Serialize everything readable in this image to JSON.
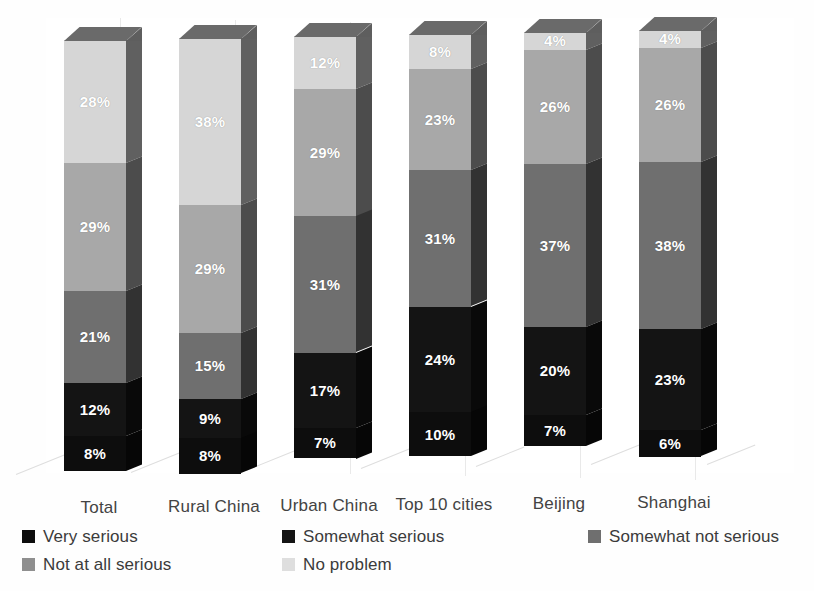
{
  "chart_data": {
    "type": "bar",
    "subtype": "stacked-column-100-3d",
    "title": "",
    "subtitle": "",
    "xlabel": "",
    "ylabel": "",
    "ylim": [
      0,
      100
    ],
    "grid": true,
    "legend_position": "bottom",
    "categories": [
      "Total",
      "Rural China",
      "Urban China",
      "Top 10 cities",
      "Beijing",
      "Shanghai"
    ],
    "series": [
      {
        "name": "Very serious",
        "color": "#0d0d0d",
        "values": [
          8,
          8,
          7,
          10,
          7,
          6
        ],
        "labels": [
          "8%",
          "8%",
          "7%",
          "10%",
          "7%",
          "6%"
        ]
      },
      {
        "name": "Somewhat serious",
        "color": "#141414",
        "values": [
          12,
          9,
          17,
          24,
          20,
          23
        ],
        "labels": [
          "12%",
          "9%",
          "17%",
          "24%",
          "20%",
          "23%"
        ]
      },
      {
        "name": "Somewhat not serious",
        "color": "#6f6f6f",
        "values": [
          21,
          15,
          31,
          31,
          37,
          38
        ],
        "labels": [
          "21%",
          "15%",
          "31%",
          "31%",
          "37%",
          "38%"
        ]
      },
      {
        "name": "Not at all serious",
        "color": "#a8a8a8",
        "values": [
          29,
          29,
          29,
          23,
          26,
          26
        ],
        "labels": [
          "29%",
          "29%",
          "29%",
          "23%",
          "26%",
          "26%"
        ]
      },
      {
        "name": "No problem",
        "color": "#d6d6d6",
        "values": [
          28,
          38,
          12,
          8,
          4,
          4
        ],
        "labels": [
          "28%",
          "38%",
          "12%",
          "8%",
          "4%",
          "4%"
        ]
      }
    ]
  },
  "legend": {
    "items": [
      {
        "label": "Very serious",
        "color": "#0d0d0d"
      },
      {
        "label": "Somewhat serious",
        "color": "#141414"
      },
      {
        "label": "Somewhat not serious",
        "color": "#6f6f6f"
      },
      {
        "label": "Not at all serious",
        "color": "#8f8f8f"
      },
      {
        "label": "No problem",
        "color": "#dedede"
      }
    ]
  },
  "palette": {
    "background": "#ffffff",
    "text": "#3b3b3b",
    "gridline": "#e9e9e9",
    "floor": "#dedede",
    "top_face": "#6a6a6a",
    "side_shade": "#2a2a2a"
  }
}
